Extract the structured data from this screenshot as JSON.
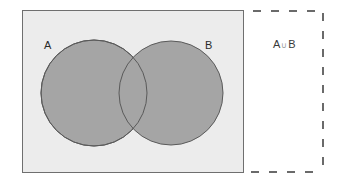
{
  "diagram": {
    "type": "venn",
    "universe": {
      "fill": "#ececec",
      "stroke": "#6f6f6f",
      "x": 22,
      "y": 10,
      "width": 221,
      "height": 162
    },
    "sets": [
      {
        "label": "A",
        "cx": 94,
        "cy": 93,
        "r": 53,
        "fill": "#a5a5a5",
        "stroke": "#5a5a5a"
      },
      {
        "label": "B",
        "cx": 171,
        "cy": 93,
        "r": 52,
        "fill": "#a5a5a5",
        "stroke": "#5a5a5a"
      }
    ],
    "result_panel": {
      "border_style": "dashed",
      "stroke": "#6a6a6a",
      "expression": {
        "left": "A",
        "operator": "∪",
        "right": "B"
      }
    }
  }
}
